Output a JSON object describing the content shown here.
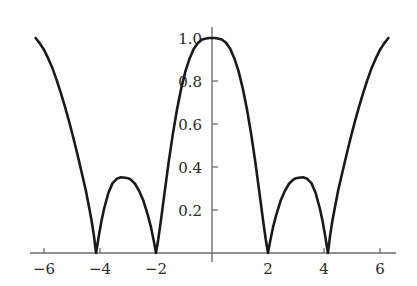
{
  "chart_data": {
    "type": "line",
    "title": "",
    "subtitle": "",
    "xlabel": "",
    "ylabel": "",
    "xlim": [
      -6.3,
      6.3
    ],
    "ylim": [
      0.0,
      1.05
    ],
    "grid": false,
    "legend": null,
    "legend_position": "none",
    "x_ticks": [
      -6,
      -4,
      -2,
      2,
      4,
      6
    ],
    "x_tick_labels": [
      "−6",
      "−4",
      "−2",
      "2",
      "4",
      "6"
    ],
    "y_ticks": [
      0.2,
      0.4,
      0.6,
      0.8,
      1.0
    ],
    "y_tick_labels": [
      "0.2",
      "0.4",
      "0.6",
      "0.8",
      "1.0"
    ],
    "zeros": [
      -4.14,
      -2.0,
      2.0,
      4.14
    ],
    "local_maxima": [
      {
        "x": -3.0,
        "y": 0.35
      },
      {
        "x": 0.0,
        "y": 1.0
      },
      {
        "x": 3.0,
        "y": 0.35
      }
    ],
    "endpoints": [
      {
        "x": -6.3,
        "y": 1.0
      },
      {
        "x": 6.3,
        "y": 1.0
      }
    ],
    "series": [
      {
        "name": "curve",
        "color": "#1a1a1a",
        "x": [
          -6.3,
          -6.15,
          -6.0,
          -5.85,
          -5.7,
          -5.55,
          -5.4,
          -5.25,
          -5.1,
          -4.95,
          -4.8,
          -4.65,
          -4.5,
          -4.4,
          -4.3,
          -4.22,
          -4.14,
          -4.05,
          -3.95,
          -3.85,
          -3.7,
          -3.55,
          -3.4,
          -3.25,
          -3.1,
          -3.0,
          -2.9,
          -2.75,
          -2.6,
          -2.45,
          -2.3,
          -2.18,
          -2.08,
          -2.0,
          -1.92,
          -1.82,
          -1.7,
          -1.55,
          -1.4,
          -1.25,
          -1.1,
          -0.95,
          -0.8,
          -0.65,
          -0.5,
          -0.35,
          -0.2,
          -0.1,
          0.0,
          0.1,
          0.2,
          0.35,
          0.5,
          0.65,
          0.8,
          0.95,
          1.1,
          1.25,
          1.4,
          1.55,
          1.7,
          1.82,
          1.92,
          2.0,
          2.08,
          2.18,
          2.3,
          2.45,
          2.6,
          2.75,
          2.9,
          3.0,
          3.1,
          3.25,
          3.4,
          3.55,
          3.7,
          3.85,
          3.95,
          4.05,
          4.14,
          4.22,
          4.3,
          4.4,
          4.5,
          4.65,
          4.8,
          4.95,
          5.1,
          5.25,
          5.4,
          5.55,
          5.7,
          5.85,
          6.0,
          6.15,
          6.3
        ],
        "y": [
          1.0,
          0.975,
          0.945,
          0.905,
          0.86,
          0.805,
          0.745,
          0.68,
          0.61,
          0.535,
          0.455,
          0.372,
          0.287,
          0.22,
          0.15,
          0.083,
          0.0,
          0.073,
          0.148,
          0.208,
          0.28,
          0.325,
          0.345,
          0.352,
          0.35,
          0.348,
          0.341,
          0.322,
          0.288,
          0.243,
          0.18,
          0.12,
          0.057,
          0.0,
          0.063,
          0.155,
          0.275,
          0.42,
          0.552,
          0.667,
          0.765,
          0.845,
          0.905,
          0.95,
          0.978,
          0.993,
          0.998,
          1.0,
          1.0,
          1.0,
          0.998,
          0.993,
          0.978,
          0.95,
          0.905,
          0.845,
          0.765,
          0.667,
          0.552,
          0.42,
          0.275,
          0.155,
          0.063,
          0.0,
          0.057,
          0.12,
          0.18,
          0.243,
          0.288,
          0.322,
          0.341,
          0.348,
          0.35,
          0.352,
          0.345,
          0.325,
          0.28,
          0.208,
          0.148,
          0.073,
          0.0,
          0.083,
          0.15,
          0.22,
          0.287,
          0.372,
          0.455,
          0.535,
          0.61,
          0.68,
          0.745,
          0.805,
          0.86,
          0.905,
          0.945,
          0.975,
          1.0
        ]
      }
    ],
    "colors": {
      "curve": "#1a1a1a",
      "axis": "#6e6e6e",
      "tick_label": "#2b2b2b",
      "background": "#ffffff"
    }
  }
}
